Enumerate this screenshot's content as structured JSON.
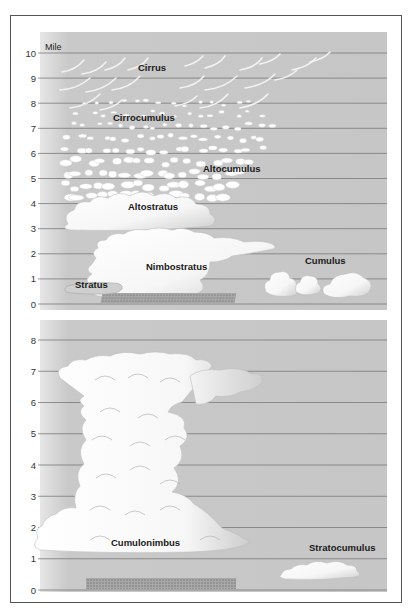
{
  "unit_label": "Mile",
  "colors": {
    "panel_bg": "#c8c8c8",
    "panel_edge": "#e4e4e4",
    "gridline": "#7a7a7a",
    "cloud_fill": "#ffffff",
    "cloud_shade": "#d9d9d9",
    "rain": "#7d7d7d",
    "frame": "#555555",
    "label": "#1a1a1a"
  },
  "panels": [
    {
      "id": "upper",
      "y_ticks": [
        "0",
        "1",
        "2",
        "3",
        "4",
        "5",
        "6",
        "7",
        "8",
        "9",
        "10"
      ],
      "y_range_miles": [
        0,
        10
      ],
      "clouds": [
        {
          "name": "Cirrus",
          "altitude_miles": [
            7.8,
            10
          ]
        },
        {
          "name": "Cirrocumulus",
          "altitude_miles": [
            5.5,
            8
          ]
        },
        {
          "name": "Altocumulus",
          "altitude_miles": [
            3.5,
            6.5
          ]
        },
        {
          "name": "Altostratus",
          "altitude_miles": [
            3.2,
            5
          ]
        },
        {
          "name": "Nimbostratus",
          "altitude_miles": [
            0.5,
            2.5
          ]
        },
        {
          "name": "Cumulus",
          "altitude_miles": [
            0.5,
            1.5
          ]
        },
        {
          "name": "Stratus",
          "altitude_miles": [
            0.2,
            1
          ]
        }
      ]
    },
    {
      "id": "lower",
      "y_ticks": [
        "0",
        "1",
        "2",
        "3",
        "4",
        "5",
        "6",
        "7",
        "8"
      ],
      "y_range_miles": [
        0,
        8
      ],
      "clouds": [
        {
          "name": "Cumulonimbus",
          "altitude_miles": [
            0.3,
            7.5
          ]
        },
        {
          "name": "Stratocumulus",
          "altitude_miles": [
            0.4,
            0.9
          ]
        }
      ]
    }
  ]
}
